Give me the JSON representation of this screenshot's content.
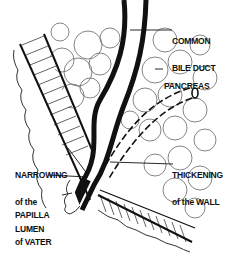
{
  "diagram": {
    "labels": {
      "common_bile_duct": [
        "COMMON",
        "BILE DUCT"
      ],
      "pancreas": "PANCREAS",
      "narrowing": [
        "NARROWING",
        "of the",
        "LUMEN"
      ],
      "thickening": [
        "THICKENING",
        "of the WALL"
      ],
      "papilla": [
        "PAPILLA",
        "of VATER"
      ]
    },
    "colors": {
      "ink": "#111111",
      "background": "#ffffff",
      "cell_outline": "#555555"
    }
  }
}
